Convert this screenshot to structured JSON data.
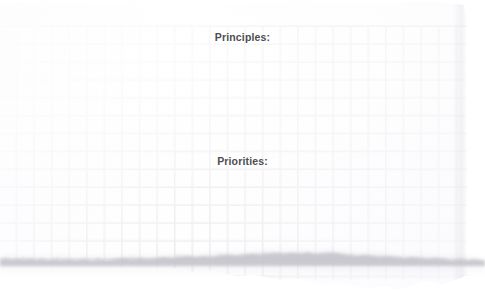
{
  "note": {
    "medium": "torn grid / graph paper sheet",
    "background_color": "#ffffff",
    "paper_color": "#fefeff",
    "grid_line_color": "#e7e7ea",
    "text_color": "#4d4d52",
    "grid_cell_px": 18,
    "headings": [
      {
        "id": "principles",
        "text": "Principles:",
        "align": "center"
      },
      {
        "id": "priorities",
        "text": "Priorities:",
        "align": "center"
      }
    ],
    "body_content": ""
  }
}
